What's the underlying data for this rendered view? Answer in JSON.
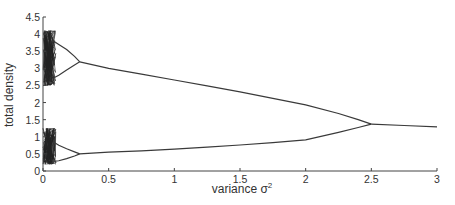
{
  "chart_data": {
    "type": "line",
    "title": "",
    "xlabel": "variance σ²",
    "xlabel_base": "variance σ",
    "xlabel_sup": "2",
    "ylabel": "total density",
    "xlim": [
      0,
      3
    ],
    "ylim": [
      0,
      4.5
    ],
    "grid": false,
    "legend": null,
    "x_ticks": [
      0,
      0.5,
      1,
      1.5,
      2,
      2.5,
      3
    ],
    "x_tick_labels": [
      "0",
      "0.5",
      "1",
      "1.5",
      "2",
      "2.5",
      "3"
    ],
    "y_ticks": [
      0,
      0.5,
      1,
      1.5,
      2,
      2.5,
      3,
      3.5,
      4,
      4.5
    ],
    "y_tick_labels": [
      "0",
      "0.5",
      "1",
      "1.5",
      "2",
      "2.5",
      "3",
      "3.5",
      "4",
      "4.5"
    ],
    "annotations": [
      "chaotic region for variance 0 to ~0.1 (upper band ~2.5–4.1, lower band ~0.2–1.25)",
      "period-4 to period-2 bifurcation at variance ≈ 0.28",
      "period-2 branches merge at variance ≈ 2.5, density ≈ 1.37"
    ],
    "series": [
      {
        "name": "upper branch (period 2)",
        "x": [
          0.28,
          0.5,
          0.75,
          1.0,
          1.25,
          1.5,
          1.75,
          2.0,
          2.25,
          2.4,
          2.5
        ],
        "values": [
          3.19,
          3.0,
          2.83,
          2.66,
          2.49,
          2.31,
          2.12,
          1.93,
          1.68,
          1.5,
          1.37
        ]
      },
      {
        "name": "lower branch (period 2)",
        "x": [
          0.28,
          0.5,
          0.75,
          1.0,
          1.25,
          1.5,
          1.75,
          2.0,
          2.25,
          2.4,
          2.5
        ],
        "values": [
          0.5,
          0.55,
          0.59,
          0.64,
          0.7,
          0.76,
          0.83,
          0.91,
          1.13,
          1.27,
          1.37
        ]
      },
      {
        "name": "single branch (period 1)",
        "x": [
          2.5,
          2.75,
          3.0
        ],
        "values": [
          1.37,
          1.33,
          1.29
        ]
      },
      {
        "name": "upper sub-branches (period 4)",
        "x": [
          0.08,
          0.12,
          0.18,
          0.24,
          0.28
        ],
        "values_high": [
          3.8,
          3.7,
          3.55,
          3.35,
          3.19
        ],
        "values_low": [
          2.72,
          2.8,
          2.95,
          3.1,
          3.19
        ]
      },
      {
        "name": "lower sub-branches (period 4)",
        "x": [
          0.08,
          0.12,
          0.18,
          0.24,
          0.28
        ],
        "values_high": [
          0.85,
          0.75,
          0.65,
          0.56,
          0.5
        ],
        "values_low": [
          0.28,
          0.3,
          0.36,
          0.44,
          0.5
        ]
      }
    ],
    "chaotic_bands": [
      {
        "x_range": [
          0,
          0.1
        ],
        "y_range": [
          2.5,
          4.1
        ]
      },
      {
        "x_range": [
          0,
          0.1
        ],
        "y_range": [
          0.2,
          1.25
        ]
      }
    ]
  }
}
